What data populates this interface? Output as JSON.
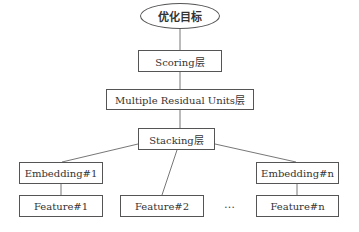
{
  "diagram": {
    "type": "hierarchy",
    "nodes": {
      "objective": "优化目标",
      "scoring": "Scoring层",
      "residual": "Multiple Residual Units层",
      "stacking": "Stacking层",
      "embedding_1": "Embedding#1",
      "embedding_n": "Embedding#n",
      "feature_1": "Feature#1",
      "feature_2": "Feature#2",
      "feature_n": "Feature#n",
      "ellipsis": "…"
    },
    "edges": [
      [
        "objective",
        "scoring"
      ],
      [
        "scoring",
        "residual"
      ],
      [
        "residual",
        "stacking"
      ],
      [
        "stacking",
        "embedding_1"
      ],
      [
        "stacking",
        "feature_2"
      ],
      [
        "stacking",
        "embedding_n"
      ],
      [
        "embedding_1",
        "feature_1"
      ],
      [
        "embedding_n",
        "feature_n"
      ]
    ],
    "colors": {
      "stroke": "#555555",
      "text": "#333333",
      "background": "#ffffff"
    }
  }
}
